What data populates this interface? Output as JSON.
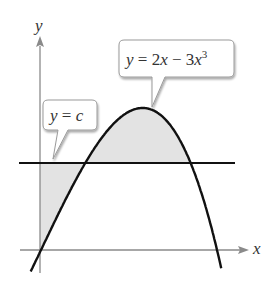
{
  "figure": {
    "axis_labels": {
      "x": "x",
      "y": "y"
    },
    "callouts": [
      {
        "id": "cubic",
        "text_y": "y",
        "text_eq": " = 2",
        "text_x": "x",
        "text_minus": " − 3",
        "text_x2": "x",
        "text_exp": "3",
        "full": "y = 2x − 3x^3"
      },
      {
        "id": "line",
        "text_y": "y",
        "text_eq": " = ",
        "text_c": "c",
        "full": "y = c"
      }
    ],
    "colors": {
      "curve": "#111111",
      "line": "#111111",
      "axis": "#8a8a8a",
      "shade": "#e3e3e3",
      "callout_border": "#9a9a9a",
      "text": "#333333"
    }
  },
  "chart_data": {
    "type": "line",
    "title": "",
    "xlabel": "x",
    "ylabel": "y",
    "series": [
      {
        "name": "y = 2x - 3x^3",
        "function": "2x - 3x^3",
        "x_roots": [
          0,
          0.8165
        ],
        "max_point": [
          0.4714,
          0.6285
        ]
      },
      {
        "name": "y = c",
        "function": "c",
        "approx_c": 0.385
      }
    ],
    "shaded_regions": [
      "between y = c and the curve above the line (arch region)",
      "between the y-axis, y = c, and the curve (left region)"
    ],
    "grid": false,
    "legend": "callout labels"
  }
}
